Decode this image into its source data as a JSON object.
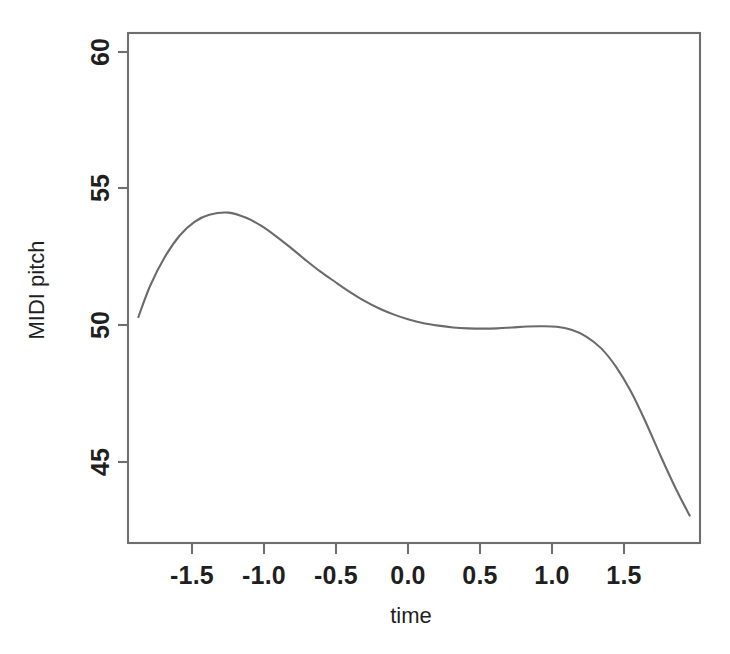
{
  "chart_data": {
    "type": "line",
    "title": "",
    "xlabel": "time",
    "ylabel": "MIDI pitch",
    "xlim": [
      -1.9,
      1.97
    ],
    "ylim": [
      44.3,
      61.05
    ],
    "grid": false,
    "legend": null,
    "xticks": [
      -1.5,
      -1.0,
      -0.5,
      0.0,
      0.5,
      1.0,
      1.5
    ],
    "xticklabels": [
      "-1.5",
      "-1.0",
      "-0.5",
      "0.0",
      "0.5",
      "1.0",
      "1.5"
    ],
    "yticks": [
      45,
      50,
      55,
      60
    ],
    "yticklabels": [
      "45",
      "50",
      "55",
      "60"
    ],
    "series": [
      {
        "name": "MIDI pitch curve",
        "color": "#6b6b6b",
        "x": [
          -1.83,
          -1.75,
          -1.65,
          -1.55,
          -1.45,
          -1.35,
          -1.22,
          -1.1,
          -1.0,
          -0.9,
          -0.8,
          -0.7,
          -0.6,
          -0.5,
          -0.4,
          -0.3,
          -0.2,
          -0.1,
          0.0,
          0.1,
          0.2,
          0.3,
          0.4,
          0.5,
          0.6,
          0.7,
          0.8,
          0.9,
          1.0,
          1.1,
          1.2,
          1.3,
          1.4,
          1.5,
          1.6,
          1.7,
          1.8,
          1.9
        ],
        "y": [
          51.72,
          52.75,
          53.7,
          54.4,
          54.85,
          55.08,
          55.15,
          54.98,
          54.72,
          54.38,
          54.0,
          53.6,
          53.22,
          52.88,
          52.55,
          52.25,
          52.0,
          51.8,
          51.64,
          51.52,
          51.44,
          51.38,
          51.35,
          51.34,
          51.35,
          51.38,
          51.41,
          51.42,
          51.4,
          51.3,
          51.08,
          50.7,
          50.1,
          49.3,
          48.3,
          47.2,
          46.15,
          45.2
        ]
      }
    ],
    "annotations": []
  },
  "plot": {
    "box": {
      "left": 128,
      "top": 33,
      "right": 700,
      "bottom": 543
    },
    "frame_color": "#6e6e6e",
    "background": "#ffffff"
  }
}
